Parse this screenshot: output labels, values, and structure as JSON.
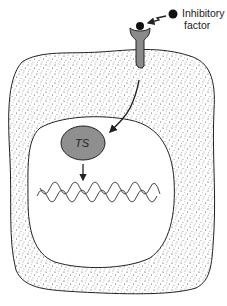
{
  "diagram": {
    "type": "cell-signaling-illustration",
    "labels": {
      "inhibitory_factor_line1": "Inhibitory",
      "inhibitory_factor_line2": "factor",
      "transcription_factor": "TS"
    },
    "elements": [
      {
        "id": "inhibitory-factor",
        "shape": "dot",
        "label": "Inhibitory factor"
      },
      {
        "id": "receptor",
        "shape": "membrane receptor bound to ligand"
      },
      {
        "id": "cytoplasm",
        "shape": "stippled irregular cell body"
      },
      {
        "id": "nucleus",
        "shape": "white rounded region"
      },
      {
        "id": "ts-protein",
        "shape": "gray ellipse",
        "label": "TS"
      },
      {
        "id": "dna",
        "shape": "double helix"
      }
    ],
    "arrows": [
      {
        "from": "inhibitory-factor",
        "to": "receptor"
      },
      {
        "from": "receptor",
        "to": "ts-protein"
      },
      {
        "from": "ts-protein",
        "to": "dna"
      }
    ],
    "colors": {
      "outline": "#222222",
      "receptor_fill": "#8a8a8a",
      "ts_fill": "#8f8f8f",
      "stipple": "#333333",
      "background": "#ffffff"
    }
  }
}
